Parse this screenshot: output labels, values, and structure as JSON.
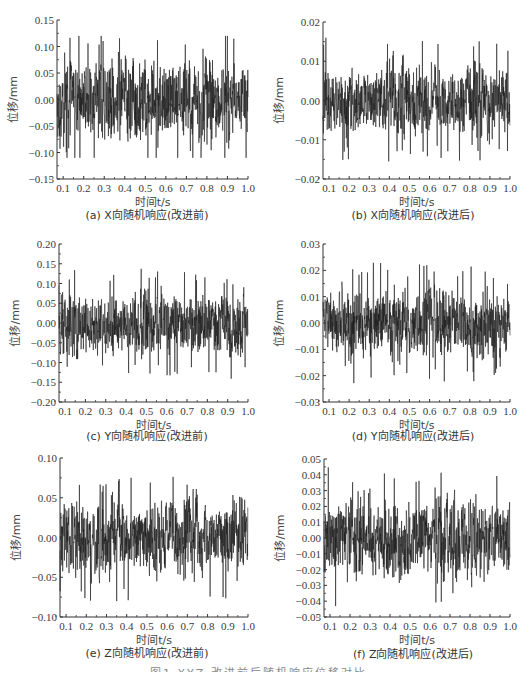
{
  "figure_caption": "图1  XYZ 改进前后随机响应位移对比",
  "chart_data": [
    {
      "id": "a",
      "type": "line",
      "caption": "(a) X向随机响应(改进前)",
      "title": "(a) X向随机响应(改进前)",
      "xlabel": "时间t/s",
      "ylabel": "位移/mm",
      "xlim": [
        0.07,
        1.0
      ],
      "ylim": [
        -0.15,
        0.15
      ],
      "xticks": [
        "0.1",
        "0.2",
        "0.3",
        "0.4",
        "0.5",
        "0.6",
        "0.7",
        "0.8",
        "0.9",
        "1.0"
      ],
      "yticks": [
        "-0.15",
        "-0.10",
        "-0.05",
        "0.00",
        "0.05",
        "0.10",
        "0.15"
      ],
      "amplitude_envelope": 0.12,
      "peak_max": 0.12,
      "peak_min": -0.11,
      "grid": false,
      "signal": "random vibration displacement response"
    },
    {
      "id": "b",
      "type": "line",
      "caption": "(b) X向随机响应(改进后)",
      "title": "(b) X向随机响应(改进后)",
      "xlabel": "时间t/s",
      "ylabel": "位移/mm",
      "xlim": [
        0.07,
        1.0
      ],
      "ylim": [
        -0.02,
        0.02
      ],
      "xticks": [
        "0.1",
        "0.2",
        "0.3",
        "0.4",
        "0.5",
        "0.6",
        "0.7",
        "0.8",
        "0.9",
        "1.0"
      ],
      "yticks": [
        "-0.02",
        "-0.01",
        "0.00",
        "0.01",
        "0.02"
      ],
      "amplitude_envelope": 0.014,
      "peak_max": 0.016,
      "peak_min": -0.018,
      "grid": false,
      "signal": "random vibration displacement response"
    },
    {
      "id": "c",
      "type": "line",
      "caption": "(c) Y向随机响应(改进前)",
      "title": "(c) Y向随机响应(改进前)",
      "xlabel": "时间t/s",
      "ylabel": "位移/mm",
      "xlim": [
        0.07,
        1.0
      ],
      "ylim": [
        -0.2,
        0.2
      ],
      "xticks": [
        "0.1",
        "0.2",
        "0.3",
        "0.4",
        "0.5",
        "0.6",
        "0.7",
        "0.8",
        "0.9",
        "1.0"
      ],
      "yticks": [
        "-0.20",
        "-0.15",
        "-0.10",
        "-0.05",
        "0.00",
        "0.05",
        "0.10",
        "0.15",
        "0.20"
      ],
      "amplitude_envelope": 0.12,
      "peak_max": 0.15,
      "peak_min": -0.15,
      "grid": false,
      "signal": "random vibration displacement response"
    },
    {
      "id": "d",
      "type": "line",
      "caption": "(d) Y向随机响应(改进后)",
      "title": "(d) Y向随机响应(改进后)",
      "xlabel": "时间t/s",
      "ylabel": "位移/mm",
      "xlim": [
        0.07,
        1.0
      ],
      "ylim": [
        -0.03,
        0.03
      ],
      "xticks": [
        "0.1",
        "0.2",
        "0.3",
        "0.4",
        "0.5",
        "0.6",
        "0.7",
        "0.8",
        "0.9",
        "1.0"
      ],
      "yticks": [
        "-0.03",
        "-0.02",
        "-0.01",
        "0.00",
        "0.01",
        "0.02",
        "0.03"
      ],
      "amplitude_envelope": 0.02,
      "peak_max": 0.027,
      "peak_min": -0.026,
      "grid": false,
      "signal": "random vibration displacement response"
    },
    {
      "id": "e",
      "type": "line",
      "caption": "(e) Z向随机响应(改进前)",
      "title": "(e) Z向随机响应(改进前)",
      "xlabel": "时间t/s",
      "ylabel": "位移/mm",
      "xlim": [
        0.07,
        1.0
      ],
      "ylim": [
        -0.1,
        0.1
      ],
      "xticks": [
        "0.1",
        "0.2",
        "0.3",
        "0.4",
        "0.5",
        "0.6",
        "0.7",
        "0.8",
        "0.9",
        "1.0"
      ],
      "yticks": [
        "-0.10",
        "-0.05",
        "0.00",
        "0.05",
        "0.10"
      ],
      "amplitude_envelope": 0.07,
      "peak_max": 0.1,
      "peak_min": -0.08,
      "grid": false,
      "signal": "random vibration displacement response"
    },
    {
      "id": "f",
      "type": "line",
      "caption": "(f) Z向随机响应(改进后)",
      "title": "(f) Z向随机响应(改进后)",
      "xlabel": "时间t/s",
      "ylabel": "位移/mm",
      "xlim": [
        0.07,
        1.0
      ],
      "ylim": [
        -0.05,
        0.05
      ],
      "xticks": [
        "0.1",
        "0.2",
        "0.3",
        "0.4",
        "0.5",
        "0.6",
        "0.7",
        "0.8",
        "0.9",
        "1.0"
      ],
      "yticks": [
        "-0.05",
        "-0.04",
        "-0.03",
        "-0.02",
        "-0.01",
        "0.00",
        "0.01",
        "0.02",
        "0.03",
        "0.04",
        "0.05"
      ],
      "amplitude_envelope": 0.04,
      "peak_max": 0.048,
      "peak_min": -0.05,
      "grid": false,
      "signal": "random vibration displacement response"
    }
  ]
}
